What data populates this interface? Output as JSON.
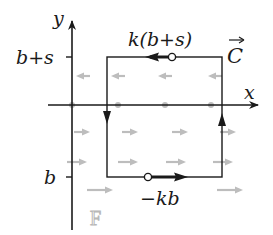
{
  "diagram": {
    "axes": {
      "x_label": "x",
      "y_label": "y",
      "y_ticks": [
        {
          "label": "b+s",
          "y": 57
        },
        {
          "label": "b",
          "y": 177
        }
      ]
    },
    "curve": {
      "label": "C",
      "label_has_arrow": true,
      "rect": {
        "left": 107,
        "right": 222,
        "top": 57,
        "bottom": 177
      },
      "orientation": "clockwise",
      "top_edge_label": "k(b+s)",
      "top_edge_arrow_direction": "left",
      "bottom_edge_label": "−kb",
      "bottom_edge_arrow_direction": "right",
      "left_edge_arrow_direction": "down",
      "right_edge_arrow_direction": "up"
    },
    "field": {
      "label": "F",
      "color": "#bdbdbd",
      "rows": [
        {
          "y": 76,
          "direction": "left",
          "xs": [
            83,
            118,
            165,
            215
          ]
        },
        {
          "y": 105,
          "direction": "zero",
          "xs": [
            72,
            118,
            165,
            211
          ]
        },
        {
          "y": 132,
          "direction": "right",
          "xs": [
            82,
            130,
            180,
            228
          ]
        },
        {
          "y": 162,
          "direction": "right",
          "xs": [
            77,
            128,
            176,
            223
          ]
        },
        {
          "y": 190,
          "direction": "right",
          "xs": [
            100,
            230
          ]
        }
      ]
    },
    "colors": {
      "curve": "#1a1a1a",
      "axes": "#1a1a1a",
      "field": "#bdbdbd",
      "background": "#ffffff"
    }
  }
}
